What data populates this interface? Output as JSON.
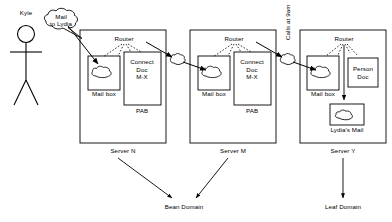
{
  "diagram": {
    "actor": {
      "name": "Kyle",
      "icon": "stick-figure-icon"
    },
    "speech_bubble": {
      "line1": "Mail",
      "line2": "to Lydia"
    },
    "transit_label": "Calls at 9am",
    "servers": [
      {
        "id": "server-n",
        "label": "Server N",
        "router_label": "Router",
        "mailbox_label": "Mail box",
        "doc_box": {
          "line1": "Connect",
          "line2": "Doc",
          "line3": "M-X"
        },
        "pab_label": "PAB"
      },
      {
        "id": "server-m",
        "label": "Server M",
        "router_label": "Router",
        "mailbox_label": "Mail box",
        "doc_box": {
          "line1": "Connect",
          "line2": "Doc",
          "line3": "M-X"
        },
        "pab_label": "PAB"
      },
      {
        "id": "server-y",
        "label": "Server Y",
        "router_label": "Router",
        "mailbox_label": "Mail box",
        "person_doc": {
          "line1": "Person",
          "line2": "Doc"
        },
        "lydias_mail_label": "Lydia's Mail"
      }
    ],
    "domains": [
      {
        "id": "bean-domain",
        "label": "Bean Domain"
      },
      {
        "id": "leaf-domain",
        "label": "Leaf Domain"
      }
    ],
    "colors": {
      "stroke": "#000000",
      "background": "#ffffff"
    }
  }
}
